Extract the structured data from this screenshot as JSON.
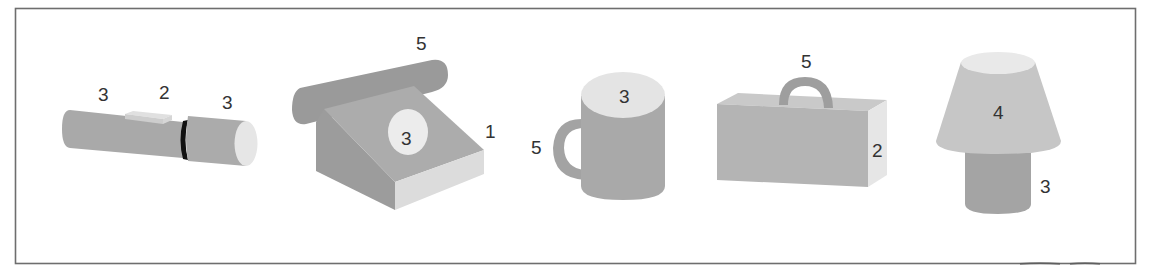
{
  "figure": {
    "type": "illustration",
    "colors": {
      "frame": "#6e6e6e",
      "dark_gray": "#9a9a9a",
      "mid_gray": "#a9a9a9",
      "light_gray": "#c4c4c4",
      "very_light": "#e3e3e3",
      "black_ring": "#111111",
      "label_text": "#333333"
    },
    "objects": [
      {
        "name": "flashlight",
        "labels": [
          {
            "part": "body",
            "text": "3"
          },
          {
            "part": "switch",
            "text": "2"
          },
          {
            "part": "head",
            "text": "3"
          }
        ]
      },
      {
        "name": "telephone",
        "labels": [
          {
            "part": "handset",
            "text": "5"
          },
          {
            "part": "dial",
            "text": "3"
          },
          {
            "part": "base",
            "text": "1"
          }
        ]
      },
      {
        "name": "mug",
        "labels": [
          {
            "part": "cup",
            "text": "3"
          },
          {
            "part": "handle",
            "text": "5"
          }
        ]
      },
      {
        "name": "briefcase",
        "labels": [
          {
            "part": "handle",
            "text": "5"
          },
          {
            "part": "box",
            "text": "2"
          }
        ]
      },
      {
        "name": "lamp",
        "labels": [
          {
            "part": "shade",
            "text": "4"
          },
          {
            "part": "base",
            "text": "3"
          }
        ]
      }
    ]
  }
}
